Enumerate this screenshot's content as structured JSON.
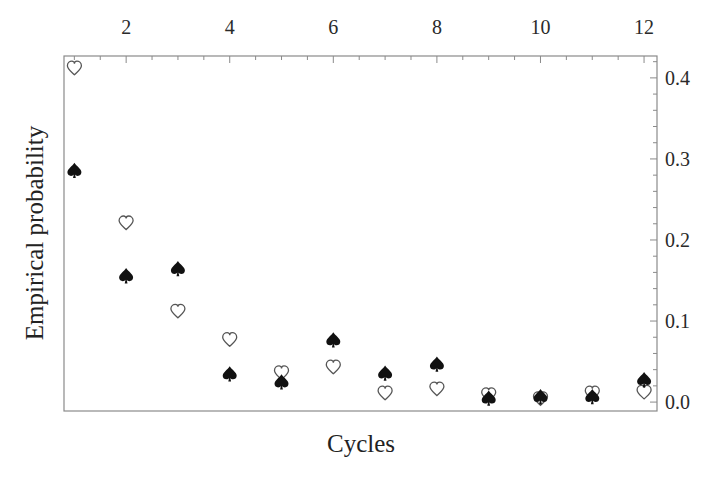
{
  "chart_data": {
    "type": "scatter",
    "title": "",
    "xlabel": "Cycles",
    "ylabel": "Empirical probability",
    "xlim": [
      0.8,
      12.25
    ],
    "ylim": [
      -0.011,
      0.427
    ],
    "x_axis_position": "top",
    "y_axis_position": "right",
    "x_ticks": [
      2,
      4,
      6,
      8,
      10,
      12
    ],
    "x_tick_labels": [
      "2",
      "4",
      "6",
      "8",
      "10",
      "12"
    ],
    "x_minor_step": 0.5,
    "y_ticks": [
      0.0,
      0.1,
      0.2,
      0.3,
      0.4
    ],
    "y_tick_labels": [
      "0.0",
      "0.1",
      "0.2",
      "0.3",
      "0.4"
    ],
    "y_minor_step": 0.02,
    "grid": false,
    "legend": null,
    "x": [
      1,
      2,
      3,
      4,
      5,
      6,
      7,
      8,
      9,
      10,
      11,
      12
    ],
    "series": [
      {
        "name": "heart",
        "marker": "open-heart",
        "values": [
          0.412,
          0.221,
          0.112,
          0.077,
          0.036,
          0.043,
          0.011,
          0.016,
          0.009,
          0.004,
          0.011,
          0.012
        ]
      },
      {
        "name": "spade",
        "marker": "filled-spade",
        "values": [
          0.286,
          0.156,
          0.165,
          0.035,
          0.025,
          0.077,
          0.036,
          0.047,
          0.005,
          0.007,
          0.007,
          0.028
        ]
      }
    ]
  },
  "colors": {
    "frame": "#8a8a8a",
    "spade_fill": "#111111",
    "heart_stroke": "#555555",
    "background": "#ffffff"
  }
}
